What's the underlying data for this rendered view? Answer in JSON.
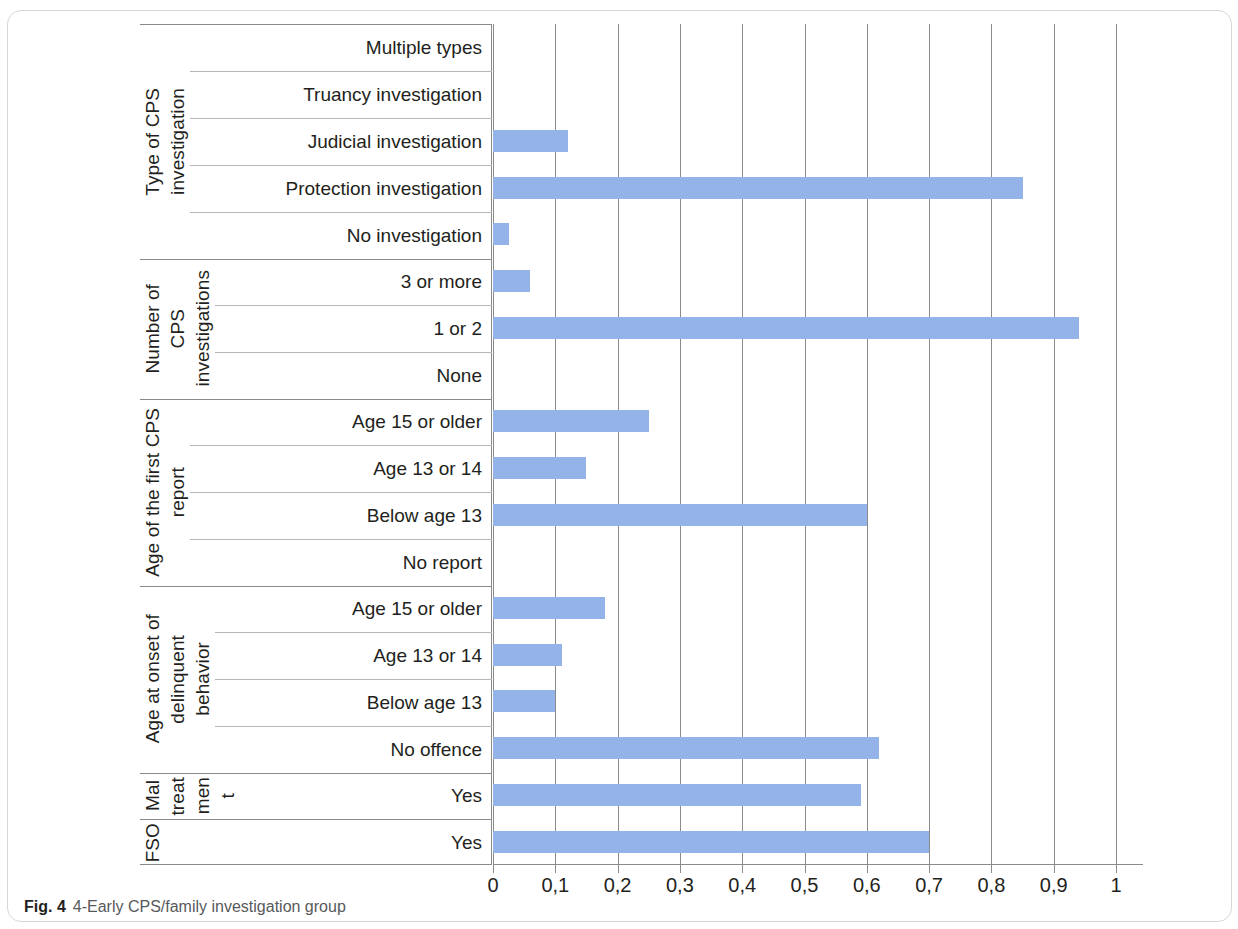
{
  "caption": {
    "figure_number": "Fig. 4",
    "text": "4-Early CPS/family investigation group"
  },
  "colors": {
    "bar": "#94b3e8",
    "grid": "#8a8a8a",
    "rule": "#b6b6b6",
    "text": "#231f20",
    "caption": "#58595b"
  },
  "axis": {
    "ticks": [
      "0",
      "0,1",
      "0,2",
      "0,3",
      "0,4",
      "0,5",
      "0,6",
      "0,7",
      "0,8",
      "0,9",
      "1"
    ]
  },
  "groups": [
    {
      "header_parts": [
        "Type of CPS",
        "investigation"
      ],
      "rows": [
        {
          "label": "Multiple types",
          "value": 0
        },
        {
          "label": "Truancy investigation",
          "value": 0
        },
        {
          "label": "Judicial investigation",
          "value": 0.12
        },
        {
          "label": "Protection investigation",
          "value": 0.85
        },
        {
          "label": "No investigation",
          "value": 0.025
        }
      ]
    },
    {
      "header_parts": [
        "Number of",
        "CPS",
        "investigations"
      ],
      "rows": [
        {
          "label": "3 or more",
          "value": 0.06
        },
        {
          "label": "1 or 2",
          "value": 0.94
        },
        {
          "label": "None",
          "value": 0
        }
      ]
    },
    {
      "header_parts": [
        "Age of the first CPS",
        "report"
      ],
      "rows": [
        {
          "label": "Age 15 or older",
          "value": 0.25
        },
        {
          "label": "Age 13 or 14",
          "value": 0.15
        },
        {
          "label": "Below age 13",
          "value": 0.6
        },
        {
          "label": "No report",
          "value": 0
        }
      ]
    },
    {
      "header_parts": [
        "Age at onset of",
        "delinquent",
        "behavior"
      ],
      "rows": [
        {
          "label": "Age 15 or older",
          "value": 0.18
        },
        {
          "label": "Age 13 or 14",
          "value": 0.11
        },
        {
          "label": "Below age 13",
          "value": 0.1
        },
        {
          "label": "No offence",
          "value": 0.62
        }
      ]
    },
    {
      "header_parts": [
        "Mal",
        "treat",
        "men",
        "t"
      ],
      "rows": [
        {
          "label": "Yes",
          "value": 0.59
        }
      ]
    },
    {
      "header_parts": [
        "FSO"
      ],
      "rows": [
        {
          "label": "Yes",
          "value": 0.7
        }
      ]
    }
  ],
  "chart_data": {
    "type": "bar",
    "orientation": "horizontal",
    "title": "4-Early CPS/family investigation group",
    "xlabel": "",
    "ylabel": "",
    "xlim": [
      0,
      1
    ],
    "grid": true,
    "legend": "none",
    "decimal_separator": ",",
    "xticks": [
      0,
      0.1,
      0.2,
      0.3,
      0.4,
      0.5,
      0.6,
      0.7,
      0.8,
      0.9,
      1
    ],
    "categories": [
      "Multiple types",
      "Truancy investigation",
      "Judicial investigation",
      "Protection investigation",
      "No investigation",
      "3 or more",
      "1 or 2",
      "None",
      "Age 15 or older",
      "Age 13 or 14",
      "Below age 13",
      "No report",
      "Age 15 or older",
      "Age 13 or 14",
      "Below age 13",
      "No offence",
      "Yes",
      "Yes"
    ],
    "values": [
      0,
      0,
      0.12,
      0.85,
      0.025,
      0.06,
      0.94,
      0,
      0.25,
      0.15,
      0.6,
      0,
      0.18,
      0.11,
      0.1,
      0.62,
      0.59,
      0.7
    ],
    "group_labels": [
      "Type of CPS investigation",
      "Number of CPS investigations",
      "Age of the first CPS report",
      "Age at onset of delinquent behavior",
      "Maltreatment",
      "FSO"
    ]
  }
}
